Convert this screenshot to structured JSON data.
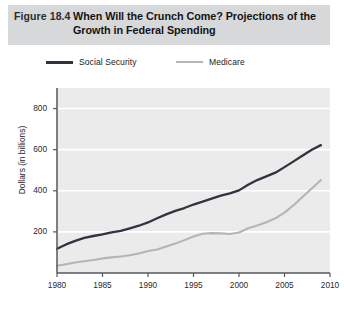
{
  "header": {
    "figure_number": "Figure 18.4",
    "title": "When Will the Crunch Come? Projections of the Growth in Federal Spending",
    "band_color": "#d7d8da"
  },
  "legend": {
    "position": "top",
    "items": [
      {
        "label": "Social Security",
        "color": "#31343f",
        "icon": "line-swatch"
      },
      {
        "label": "Medicare",
        "color": "#b3b5b6",
        "icon": "line-swatch"
      }
    ]
  },
  "axes": {
    "y_title": "Dollars (in billions)",
    "y_ticks": [
      "200",
      "400",
      "600",
      "800"
    ],
    "x_ticks": [
      "1980",
      "1985",
      "1990",
      "1995",
      "2000",
      "2005",
      "2010"
    ]
  },
  "plot_style": {
    "background": "#ebebeb",
    "gridline_color": "#ffffff",
    "axis_color": "#55585c"
  },
  "chart_data": {
    "type": "line",
    "title": "When Will the Crunch Come? Projections of the Growth in Federal Spending",
    "xlabel": "",
    "ylabel": "Dollars (in billions)",
    "xlim": [
      1980,
      2010
    ],
    "ylim": [
      0,
      900
    ],
    "ytick_values": [
      200,
      400,
      600,
      800
    ],
    "xtick_values": [
      1980,
      1985,
      1990,
      1995,
      2000,
      2005,
      2010
    ],
    "grid": "horizontal",
    "legend_position": "top",
    "x": [
      1980,
      1981,
      1982,
      1983,
      1984,
      1985,
      1986,
      1987,
      1988,
      1989,
      1990,
      1991,
      1992,
      1993,
      1994,
      1995,
      1996,
      1997,
      1998,
      1999,
      2000,
      2001,
      2002,
      2003,
      2004,
      2005,
      2006,
      2007,
      2008,
      2009
    ],
    "series": [
      {
        "name": "Social Security",
        "color": "#31343f",
        "values": [
          118,
          139,
          156,
          171,
          180,
          188,
          198,
          205,
          217,
          230,
          246,
          266,
          285,
          302,
          316,
          333,
          347,
          362,
          376,
          387,
          402,
          429,
          452,
          470,
          488,
          515,
          543,
          572,
          600,
          622
        ]
      },
      {
        "name": "Medicare",
        "color": "#b3b5b6",
        "values": [
          35,
          43,
          51,
          57,
          63,
          71,
          76,
          80,
          86,
          95,
          107,
          114,
          129,
          143,
          160,
          178,
          191,
          194,
          193,
          190,
          197,
          218,
          231,
          247,
          266,
          294,
          330,
          371,
          411,
          452
        ]
      }
    ]
  },
  "source_note": ""
}
